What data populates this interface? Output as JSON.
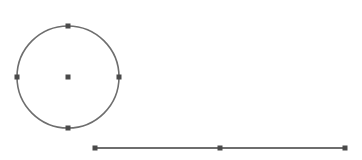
{
  "canvas": {
    "width": 362,
    "height": 160,
    "background": "#ffffff"
  },
  "colors": {
    "stroke": "#6e6e6e",
    "handle": "#4a4a4a"
  },
  "shapes": {
    "circle": {
      "cx": 68,
      "cy": 77,
      "r": 51,
      "handles": [
        [
          68,
          26
        ],
        [
          119,
          77
        ],
        [
          68,
          128
        ],
        [
          17,
          77
        ],
        [
          68,
          77
        ]
      ]
    },
    "line": {
      "x1": 95,
      "y1": 148,
      "x2": 345,
      "y2": 148,
      "handles": [
        [
          95,
          148
        ],
        [
          220,
          148
        ],
        [
          345,
          148
        ]
      ]
    }
  }
}
